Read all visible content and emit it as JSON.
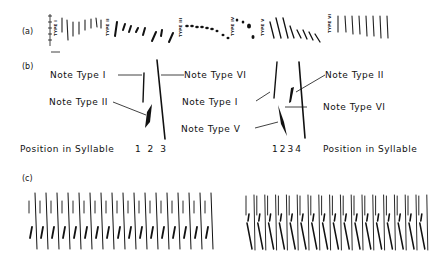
{
  "figure": {
    "panels": {
      "a": {
        "label": "(a)",
        "type_labels": [
          "TYPE I",
          "TYPE II",
          "TYPE III",
          "TYPE IV",
          "TYPE V",
          "TYPE VI"
        ]
      },
      "b": {
        "label": "(b)",
        "left": {
          "annotations": [
            "Note Type I",
            "Note Type II",
            "Note Type VI"
          ],
          "position_label": "Position in Syllable",
          "positions": "1 2 3"
        },
        "right": {
          "annotations": [
            "Note Type I",
            "Note Type V",
            "Note Type II",
            "Note Type VI"
          ],
          "position_label": "Position in Syllable",
          "positions": "1234"
        }
      },
      "c": {
        "label": "(c)"
      }
    }
  }
}
